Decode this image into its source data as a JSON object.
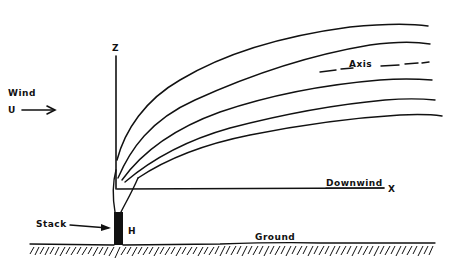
{
  "diagram": {
    "type": "plume-dispersion-schematic",
    "labels": {
      "wind": "Wind",
      "wind_symbol": "U",
      "z_axis": "Z",
      "x_axis": "X",
      "downwind": "Downwind",
      "axis": "Axis",
      "stack": "Stack",
      "stack_height": "H",
      "ground": "Ground"
    },
    "colors": {
      "ink": "#111111",
      "background": "#ffffff"
    },
    "plume": {
      "boundary_count": 5,
      "centerline_style": "dashed"
    }
  }
}
